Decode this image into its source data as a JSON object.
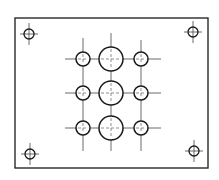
{
  "drawing": {
    "type": "plate-hole-pattern",
    "stroke_color": "#1a1a1a",
    "centerline_color": "#444444",
    "background": "#ffffff",
    "plate": {
      "x": 15,
      "y": 18,
      "width": 193,
      "height": 150
    },
    "corner_holes": [
      {
        "id": "top-left",
        "cx": 29,
        "cy": 34,
        "r": 5
      },
      {
        "id": "top-right",
        "cx": 193,
        "cy": 32,
        "r": 5
      },
      {
        "id": "bottom-left",
        "cx": 30,
        "cy": 154,
        "r": 5
      },
      {
        "id": "bottom-right",
        "cx": 194,
        "cy": 151,
        "r": 5
      }
    ],
    "grid": {
      "columns_x": [
        83,
        111,
        141
      ],
      "rows_y": [
        59,
        93,
        128
      ],
      "small_r": 7,
      "large_r": 12,
      "h_line_start": 65,
      "h_line_end": 161,
      "v_line_top": [
        38,
        33,
        40
      ],
      "v_line_bottom": 151
    },
    "grid_holes": [
      {
        "row": 0,
        "col": 0,
        "size": "small"
      },
      {
        "row": 0,
        "col": 1,
        "size": "large"
      },
      {
        "row": 0,
        "col": 2,
        "size": "small"
      },
      {
        "row": 1,
        "col": 0,
        "size": "small"
      },
      {
        "row": 1,
        "col": 1,
        "size": "large"
      },
      {
        "row": 1,
        "col": 2,
        "size": "small"
      },
      {
        "row": 2,
        "col": 0,
        "size": "small"
      },
      {
        "row": 2,
        "col": 1,
        "size": "large"
      },
      {
        "row": 2,
        "col": 2,
        "size": "small"
      }
    ]
  }
}
